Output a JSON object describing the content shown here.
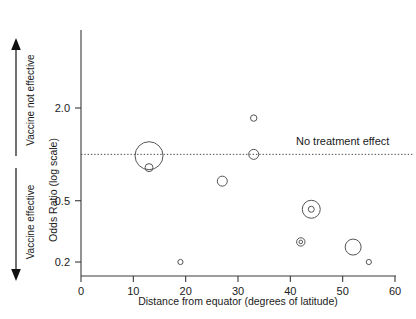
{
  "chart_data": {
    "type": "scatter",
    "title": "",
    "xlabel": "Distance from equator (degrees of latitude)",
    "ylabel": "Odds Ratio (log scale)",
    "xlim": [
      0,
      60
    ],
    "ylim": [
      0.175,
      2.9
    ],
    "yscale": "log",
    "grid": false,
    "legend": "none",
    "xticks": [
      0,
      10,
      20,
      30,
      40,
      50,
      60
    ],
    "xticklabels": [
      "0",
      "10",
      "20",
      "30",
      "40",
      "50",
      "60"
    ],
    "yticks": [
      2.0,
      0.5,
      0.2
    ],
    "yticklabels": [
      "2.0",
      "0.5",
      "0.2"
    ],
    "reference_line": {
      "y": 1.0,
      "style": "dotted",
      "label": "No treatment effect"
    },
    "axis_annotations": [
      {
        "text": "Vaccine not effective",
        "direction": "up",
        "position": "left-upper"
      },
      {
        "text": "Vaccine effective",
        "direction": "down",
        "position": "left-lower"
      }
    ],
    "marker": "open-circle",
    "size_encodes": "study weight",
    "points": [
      {
        "x": 13,
        "y": 0.98,
        "r": 14.0
      },
      {
        "x": 13,
        "y": 0.82,
        "r": 4.0
      },
      {
        "x": 19,
        "y": 0.2,
        "r": 2.6
      },
      {
        "x": 27,
        "y": 0.67,
        "r": 5.0
      },
      {
        "x": 33,
        "y": 1.72,
        "r": 3.2
      },
      {
        "x": 33,
        "y": 1.0,
        "r": 5.0
      },
      {
        "x": 42,
        "y": 0.27,
        "r": 4.2
      },
      {
        "x": 42,
        "y": 0.27,
        "r": 1.8
      },
      {
        "x": 44,
        "y": 0.44,
        "r": 9.0
      },
      {
        "x": 44,
        "y": 0.44,
        "r": 3.0
      },
      {
        "x": 52,
        "y": 0.25,
        "r": 8.0
      },
      {
        "x": 55,
        "y": 0.2,
        "r": 2.6
      }
    ]
  },
  "colors": {
    "axis": "#3a3a3a",
    "marker": "#555555",
    "text": "#1a1a1a",
    "reference": "#4a4a4a"
  }
}
